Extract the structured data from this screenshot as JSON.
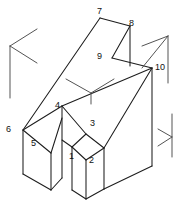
{
  "figure": {
    "background_color": "#ffffff",
    "line_color": "#1d1d1d",
    "axis_mark_color": "#4a4a4a",
    "canvas": {
      "width": 178,
      "height": 206
    },
    "vertex_labels": [
      {
        "id": "1",
        "text": "1",
        "x": 69,
        "y": 152
      },
      {
        "id": "2",
        "text": "2",
        "x": 89,
        "y": 156
      },
      {
        "id": "3",
        "text": "3",
        "x": 90,
        "y": 119
      },
      {
        "id": "4",
        "text": "4",
        "x": 55,
        "y": 101
      },
      {
        "id": "5",
        "text": "5",
        "x": 31,
        "y": 139
      },
      {
        "id": "6",
        "text": "6",
        "x": 6,
        "y": 125
      },
      {
        "id": "7",
        "text": "7",
        "x": 97,
        "y": 7
      },
      {
        "id": "8",
        "text": "8",
        "x": 129,
        "y": 19
      },
      {
        "id": "9",
        "text": "9",
        "x": 97,
        "y": 52
      },
      {
        "id": "10",
        "text": "10",
        "x": 155,
        "y": 63
      }
    ],
    "axis_marks": [
      {
        "name": "axis-indicator-left",
        "x": 10,
        "y": 46
      },
      {
        "name": "axis-indicator-center",
        "x": 66,
        "y": 79
      },
      {
        "name": "axis-indicator-upper-right",
        "x": 142,
        "y": 32
      },
      {
        "name": "axis-indicator-lower-right",
        "x": 152,
        "y": 120
      }
    ]
  }
}
